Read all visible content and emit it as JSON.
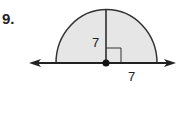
{
  "problem": {
    "number": "9.",
    "radius_vertical_label": "7",
    "radius_horizontal_label": "7",
    "shape": "semicircle",
    "fill_color": "#e6e6e6",
    "stroke_color": "#333333"
  }
}
